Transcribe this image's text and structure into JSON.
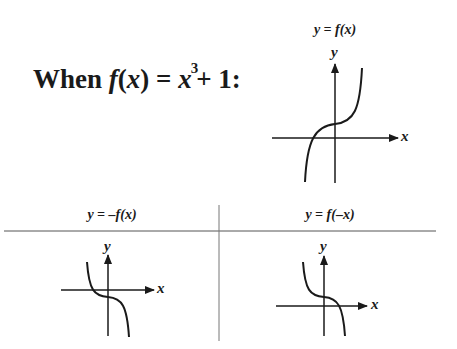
{
  "heading": {
    "prefix": "When ",
    "func": "f",
    "paren_open": "(",
    "var": "x",
    "paren_close": ")",
    "equals": " = ",
    "base": "x",
    "exponent": "3",
    "rest": "+ 1:"
  },
  "graphs": [
    {
      "id": "original",
      "title": "y = f(x)",
      "x_label": "x",
      "y_label": "y",
      "transform": "none"
    },
    {
      "id": "reflect-x-axis",
      "title": "y = –f(x)",
      "x_label": "x",
      "y_label": "y",
      "transform": "reflection across x-axis"
    },
    {
      "id": "reflect-y-axis",
      "title": "y = f(–x)",
      "x_label": "x",
      "y_label": "y",
      "transform": "reflection across y-axis"
    }
  ],
  "colors": {
    "ink": "#1a1a1a",
    "rule": "#555555",
    "background": "#ffffff"
  }
}
